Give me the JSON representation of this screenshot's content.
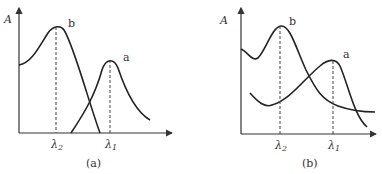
{
  "figure": {
    "panels": [
      {
        "id": "a",
        "caption": "(a)",
        "y_axis_label": "A",
        "curves": [
          {
            "name": "b",
            "label": "b",
            "peak_at": "λ2"
          },
          {
            "name": "a",
            "label": "a",
            "peak_at": "λ1"
          }
        ],
        "x_ticks": [
          {
            "symbol": "λ",
            "sub": "2"
          },
          {
            "symbol": "λ",
            "sub": "1"
          }
        ]
      },
      {
        "id": "b",
        "caption": "(b)",
        "y_axis_label": "A",
        "curves": [
          {
            "name": "b",
            "label": "b",
            "peak_at": "λ2"
          },
          {
            "name": "a",
            "label": "a",
            "peak_at": "λ1"
          }
        ],
        "x_ticks": [
          {
            "symbol": "λ",
            "sub": "2"
          },
          {
            "symbol": "λ",
            "sub": "1"
          }
        ]
      }
    ]
  }
}
